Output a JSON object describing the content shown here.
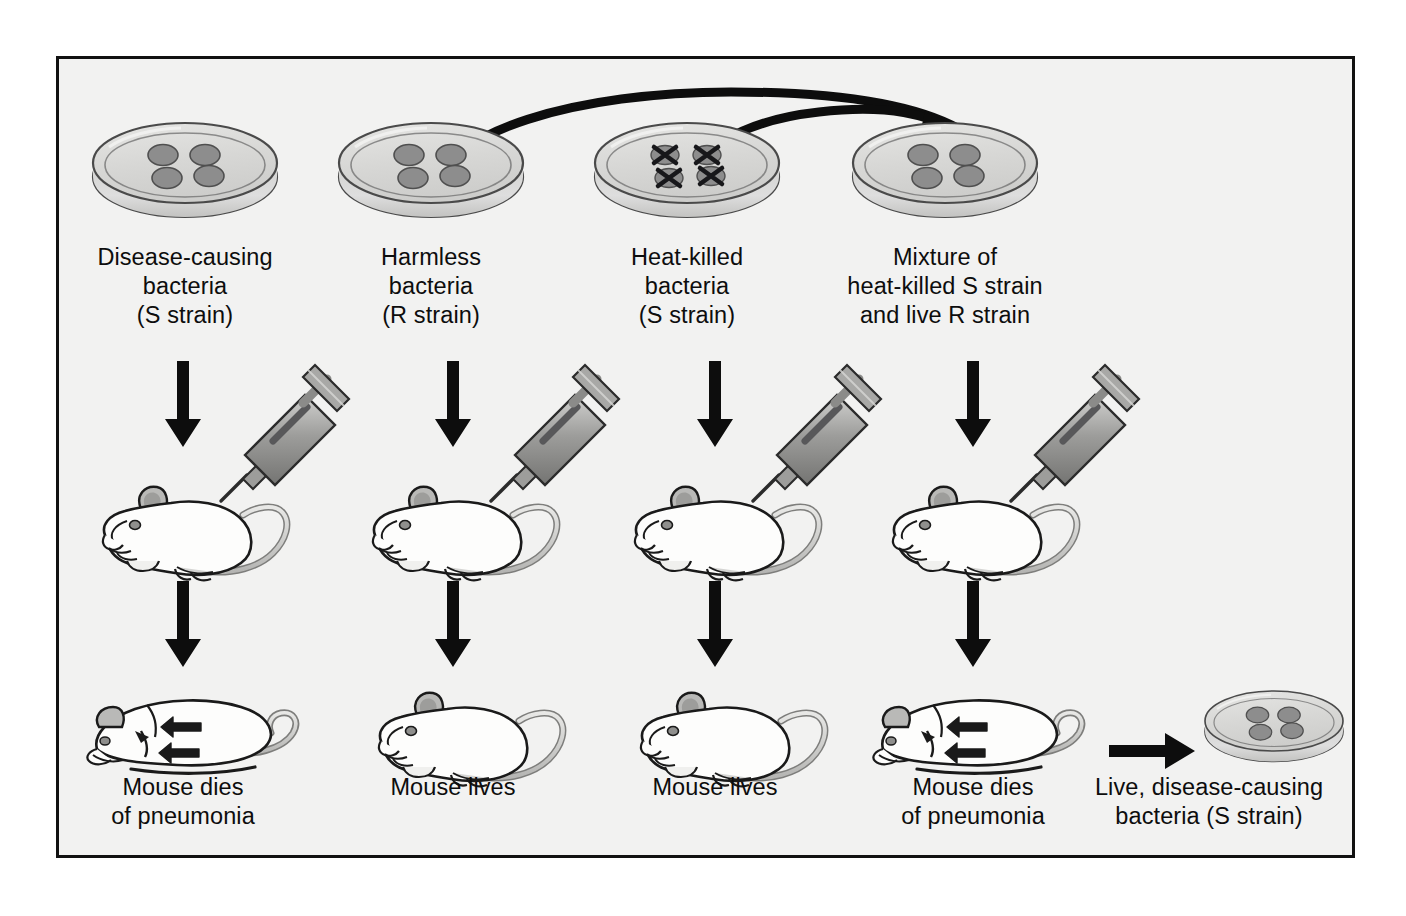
{
  "figure": {
    "title_visible": false,
    "background_color": "#f2f2f1",
    "border_color": "#111111",
    "page_background": "#ffffff"
  },
  "palette": {
    "ink": "#0d0d0d",
    "dish_fill": "#d8d8d6",
    "dish_rim": "#c8c8c5",
    "dish_edge": "#4a4a4a",
    "colony_fill": "#8d8d8d",
    "colony_edge": "#4a4a4a",
    "mouse_fill": "#fdfdfc",
    "mouse_edge": "#1a1a1a",
    "ear_fill": "#b9b9b7",
    "tail_fill": "#c9c9c7",
    "syringe_barrel": "#b5b5b3",
    "syringe_plunger": "#8f8f8d",
    "arrow": "#0d0d0d"
  },
  "columns": [
    {
      "id": "column-1",
      "dish_label": "Disease-causing\nbacteria\n(S strain)",
      "dish_state": "live-colonies",
      "colony_count": 4,
      "result_label": "Mouse dies\nof pneumonia",
      "mouse_state": "dead"
    },
    {
      "id": "column-2",
      "dish_label": "Harmless\nbacteria\n(R strain)",
      "dish_state": "live-colonies",
      "colony_count": 4,
      "result_label": "Mouse lives",
      "mouse_state": "alive"
    },
    {
      "id": "column-3",
      "dish_label": "Heat-killed\nbacteria\n(S strain)",
      "dish_state": "killed-colonies",
      "colony_count": 4,
      "result_label": "Mouse lives",
      "mouse_state": "alive"
    },
    {
      "id": "column-4",
      "dish_label": "Mixture of\nheat-killed S strain\nand live R strain",
      "dish_state": "live-colonies",
      "colony_count": 4,
      "result_label": "Mouse dies\nof pneumonia",
      "mouse_state": "dead"
    }
  ],
  "recovery": {
    "dish_label": "Live, disease-causing\nbacteria (S strain)",
    "colony_count": 4
  },
  "arrows": {
    "transfer_from_r_strain": "curved-arrow-harmless-to-mixture",
    "transfer_from_heatkilled": "curved-arrow-heatkilled-to-mixture",
    "inject_label": "downward-arrow-inject",
    "outcome_label": "downward-arrow-outcome",
    "recover_label": "rightward-arrow-recover"
  }
}
